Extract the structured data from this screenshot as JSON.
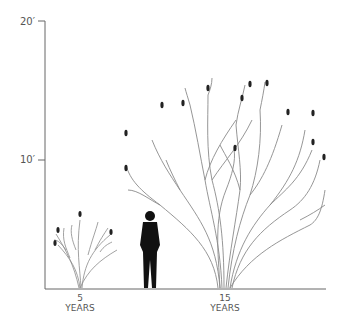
{
  "diagram": {
    "type": "tree-growth-height-comparison",
    "y_axis": {
      "ticks": [
        {
          "label": "20′",
          "value": 20
        },
        {
          "label": "10′",
          "value": 10
        }
      ]
    },
    "x_labels": [
      {
        "number": "5",
        "unit": "YEARS"
      },
      {
        "number": "15",
        "unit": "YEARS"
      }
    ],
    "figures": [
      "small-tree-5-years",
      "human-silhouette",
      "large-tree-15-years"
    ],
    "colors": {
      "axis": "#666666",
      "branches": "#888888",
      "buds": "#222222",
      "person": "#111111"
    }
  }
}
